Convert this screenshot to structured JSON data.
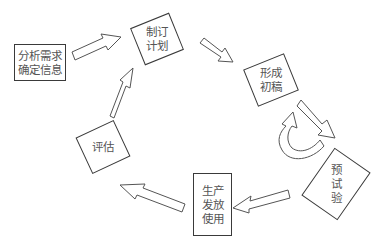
{
  "diagram": {
    "type": "cycle-flowchart",
    "nodes": [
      {
        "id": "analyze",
        "label": "分析需求\n确定信息"
      },
      {
        "id": "plan",
        "label": "制订\n计划"
      },
      {
        "id": "draft",
        "label": "形成\n初稿"
      },
      {
        "id": "pretest",
        "label": "预\n试\n验"
      },
      {
        "id": "produce",
        "label": "生产\n发放\n使用"
      },
      {
        "id": "evaluate",
        "label": "评估"
      }
    ],
    "edges": [
      {
        "from": "analyze",
        "to": "plan"
      },
      {
        "from": "plan",
        "to": "draft"
      },
      {
        "from": "draft",
        "to": "pretest"
      },
      {
        "from": "pretest",
        "to": "draft",
        "style": "curved-loop"
      },
      {
        "from": "pretest",
        "to": "produce"
      },
      {
        "from": "produce",
        "to": "evaluate"
      },
      {
        "from": "evaluate",
        "to": "plan"
      }
    ],
    "colors": {
      "stroke": "#3a3a3a",
      "text": "#555555",
      "background": "#ffffff"
    }
  }
}
